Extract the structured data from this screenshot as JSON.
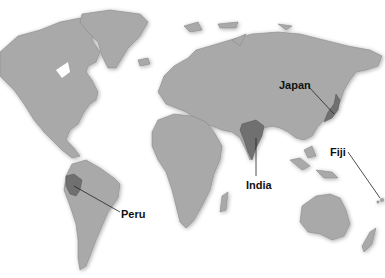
{
  "map": {
    "type": "world-political-highlight",
    "style": "grayscale shaded relief",
    "colors": {
      "land": "#a9a9a9",
      "highlight": "#6f6f6f",
      "ocean": "#ffffff",
      "label": "#111111"
    },
    "labels": [
      {
        "id": "japan",
        "text": "Japan",
        "x": 278,
        "y": 82
      },
      {
        "id": "india",
        "text": "India",
        "x": 246,
        "y": 180
      },
      {
        "id": "fiji",
        "text": "Fiji",
        "x": 330,
        "y": 148
      },
      {
        "id": "peru",
        "text": "Peru",
        "x": 120,
        "y": 210
      }
    ]
  }
}
